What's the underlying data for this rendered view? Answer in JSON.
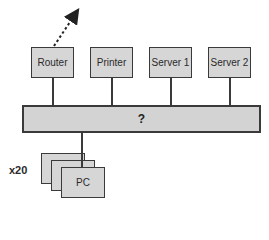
{
  "diagram": {
    "devices": [
      {
        "id": "router",
        "label": "Router"
      },
      {
        "id": "printer",
        "label": "Printer"
      },
      {
        "id": "server1",
        "label": "Server 1"
      },
      {
        "id": "server2",
        "label": "Server 2"
      }
    ],
    "bus": {
      "label": "?"
    },
    "pc": {
      "label": "PC",
      "count_label": "x20"
    },
    "arrow": {
      "style": "dashed",
      "from": "router",
      "direction": "up-right"
    },
    "colors": {
      "box_fill": "#d6d6d6",
      "stroke": "#3a3a3a",
      "background": "#ffffff"
    }
  }
}
